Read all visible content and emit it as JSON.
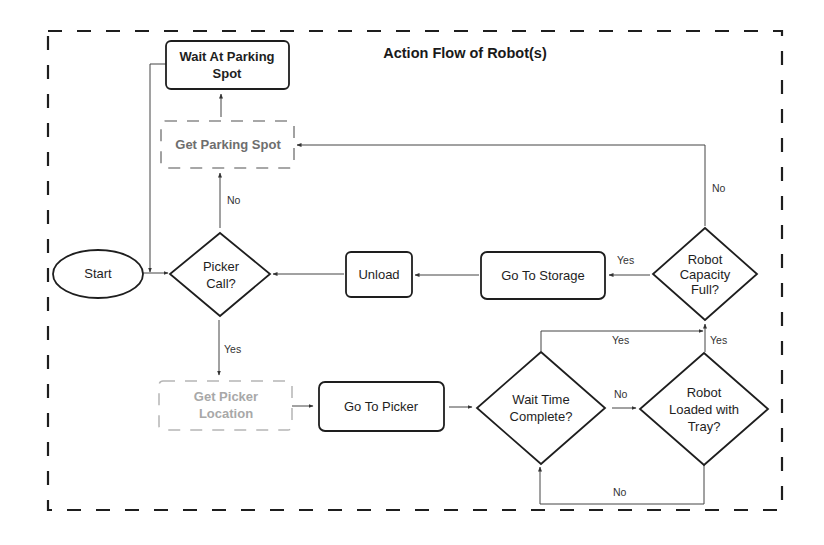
{
  "title": "Action Flow of Robot(s)",
  "nodes": {
    "start": {
      "label": "Start",
      "shape": "ellipse"
    },
    "wait_parking": {
      "line1": "Wait At Parking",
      "line2": "Spot",
      "shape": "rounded-rect"
    },
    "get_parking": {
      "label": "Get Parking Spot",
      "shape": "dashed-rect"
    },
    "picker_call": {
      "line1": "Picker",
      "line2": "Call?",
      "shape": "diamond"
    },
    "unload": {
      "label": "Unload",
      "shape": "rounded-rect"
    },
    "go_storage": {
      "label": "Go To Storage",
      "shape": "rounded-rect"
    },
    "capacity_full": {
      "line1": "Robot",
      "line2": "Capacity",
      "line3": "Full?",
      "shape": "diamond"
    },
    "get_picker_loc": {
      "line1": "Get Picker",
      "line2": "Location",
      "shape": "dashed-rect"
    },
    "go_picker": {
      "label": "Go To Picker",
      "shape": "rounded-rect"
    },
    "wait_time": {
      "line1": "Wait Time",
      "line2": "Complete?",
      "shape": "diamond"
    },
    "loaded_tray": {
      "line1": "Robot",
      "line2": "Loaded with",
      "line3": "Tray?",
      "shape": "diamond"
    }
  },
  "edges": {
    "picker_no": "No",
    "picker_yes": "Yes",
    "capacity_no": "No",
    "capacity_yes": "Yes",
    "wait_yes": "Yes",
    "wait_no": "No",
    "loaded_yes": "Yes",
    "loaded_no": "No"
  },
  "colors": {
    "stroke": "#1e1e1e",
    "line": "#444444",
    "dim_text": "#6e6e6e",
    "faint_text": "#a8a8a8",
    "dim_border": "#8a8a8a",
    "faint_border": "#b5b5b5"
  }
}
